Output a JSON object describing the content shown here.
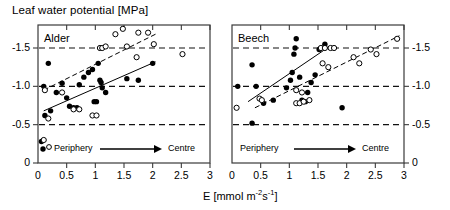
{
  "figure": {
    "y_axis_title": "Leaf water potential [MPa]",
    "x_axis_title_prefix": "E [mmol m",
    "x_axis_title_sup1": "-2",
    "x_axis_title_mid": "s",
    "x_axis_title_sup2": "-1",
    "x_axis_title_suffix": "]"
  },
  "chart_data": [
    {
      "type": "scatter",
      "title": "Alder",
      "xlabel": "E [mmol m-2s-1]",
      "ylabel": "Leaf water potential [MPa]",
      "xlim": [
        0,
        3
      ],
      "ylim": [
        0,
        -1.8
      ],
      "xticks": [
        0,
        0.5,
        1,
        1.5,
        2,
        2.5,
        3
      ],
      "xticklabels": [
        "0",
        "0.5",
        "1",
        "1.5",
        "2",
        "2.5",
        "3"
      ],
      "yticks": [
        -1.5,
        -1.0,
        -0.5,
        0
      ],
      "yticklabels": [
        "-1.5",
        "-1.0",
        "-0.5",
        "0"
      ],
      "gridlines": {
        "y": [
          -1.5,
          -1.0,
          -0.5
        ],
        "style": "dashed"
      },
      "legend_position": "inside-bottom",
      "annotation": {
        "left_label": "Periphery",
        "right_label": "Centre",
        "arrow": "right"
      },
      "series": [
        {
          "name": "filled",
          "marker": "filled-circle",
          "points": [
            [
              0.18,
              -1.3
            ],
            [
              0.1,
              -1.0
            ],
            [
              0.32,
              -0.92
            ],
            [
              0.42,
              -1.04
            ],
            [
              0.5,
              -0.85
            ],
            [
              0.55,
              -0.74
            ],
            [
              0.62,
              -0.72
            ],
            [
              0.68,
              -0.72
            ],
            [
              0.72,
              -1.02
            ],
            [
              0.8,
              -1.12
            ],
            [
              0.88,
              -1.18
            ],
            [
              0.95,
              -1.22
            ],
            [
              0.98,
              -0.8
            ],
            [
              1.02,
              -0.8
            ],
            [
              1.05,
              -1.3
            ],
            [
              1.08,
              -1.08
            ],
            [
              1.1,
              -1.05
            ],
            [
              1.12,
              -0.98
            ],
            [
              1.18,
              -0.92
            ],
            [
              1.55,
              -1.1
            ],
            [
              1.75,
              -1.08
            ],
            [
              2.0,
              -1.3
            ],
            [
              0.12,
              -0.62
            ],
            [
              0.22,
              -0.68
            ],
            [
              0.06,
              -0.28
            ]
          ]
        },
        {
          "name": "open",
          "marker": "open-circle",
          "points": [
            [
              0.12,
              -0.95
            ],
            [
              0.18,
              -0.58
            ],
            [
              0.42,
              -0.92
            ],
            [
              0.62,
              -0.7
            ],
            [
              0.72,
              -0.7
            ],
            [
              0.95,
              -0.62
            ],
            [
              1.02,
              -0.62
            ],
            [
              1.08,
              -1.5
            ],
            [
              1.12,
              -1.5
            ],
            [
              1.18,
              -1.52
            ],
            [
              1.35,
              -1.68
            ],
            [
              1.48,
              -1.75
            ],
            [
              1.55,
              -1.52
            ],
            [
              1.75,
              -1.7
            ],
            [
              1.92,
              -1.7
            ],
            [
              2.02,
              -1.55
            ],
            [
              1.72,
              -1.38
            ],
            [
              2.52,
              -1.42
            ],
            [
              0.1,
              -0.3
            ]
          ]
        }
      ],
      "fit_lines": [
        {
          "name": "filled-fit",
          "style": "solid",
          "x": [
            0.1,
            2.05
          ],
          "y": [
            -0.68,
            -1.32
          ]
        },
        {
          "name": "open-fit",
          "style": "dashed",
          "x": [
            0.1,
            2.05
          ],
          "y": [
            -0.95,
            -1.68
          ]
        }
      ]
    },
    {
      "type": "scatter",
      "title": "Beech",
      "xlabel": "E [mmol m-2s-1]",
      "ylabel": "Leaf water potential [MPa]",
      "xlim": [
        0,
        3
      ],
      "ylim": [
        0,
        -1.8
      ],
      "xticks": [
        0,
        0.5,
        1,
        1.5,
        2,
        2.5,
        3
      ],
      "xticklabels": [
        "0",
        "0.5",
        "1",
        "1.5",
        "2",
        "2.5",
        "3"
      ],
      "yticks": [
        -1.5,
        -1.0,
        -0.5,
        0
      ],
      "yticklabels": [
        "-1.5",
        "-1.0",
        "-0.5",
        "0"
      ],
      "gridlines": {
        "y": [
          -1.5,
          -1.0,
          -0.5
        ],
        "style": "dashed"
      },
      "legend_position": "inside-bottom",
      "annotation": {
        "left_label": "Periphery",
        "right_label": "Centre",
        "arrow": "right"
      },
      "series": [
        {
          "name": "filled",
          "marker": "filled-circle",
          "points": [
            [
              0.35,
              -1.28
            ],
            [
              0.1,
              -1.0
            ],
            [
              0.42,
              -1.0
            ],
            [
              0.35,
              -0.52
            ],
            [
              0.55,
              -0.78
            ],
            [
              0.72,
              -0.82
            ],
            [
              0.95,
              -0.98
            ],
            [
              1.02,
              -1.08
            ],
            [
              1.05,
              -1.18
            ],
            [
              1.08,
              -1.42
            ],
            [
              1.1,
              -1.5
            ],
            [
              1.12,
              -1.62
            ],
            [
              1.18,
              -1.12
            ],
            [
              1.22,
              -0.82
            ],
            [
              1.28,
              -0.8
            ],
            [
              1.32,
              -0.92
            ],
            [
              1.38,
              -1.05
            ],
            [
              1.45,
              -1.15
            ],
            [
              1.52,
              -1.48
            ],
            [
              1.62,
              -1.55
            ],
            [
              1.92,
              -0.72
            ]
          ]
        },
        {
          "name": "open",
          "marker": "open-circle",
          "points": [
            [
              0.48,
              -0.84
            ],
            [
              0.52,
              -0.82
            ],
            [
              1.12,
              -0.78
            ],
            [
              1.18,
              -0.78
            ],
            [
              1.25,
              -0.8
            ],
            [
              1.35,
              -0.82
            ],
            [
              1.12,
              -0.95
            ],
            [
              1.22,
              -0.92
            ],
            [
              1.55,
              -1.5
            ],
            [
              1.62,
              -1.5
            ],
            [
              1.72,
              -1.5
            ],
            [
              1.78,
              -1.5
            ],
            [
              1.58,
              -1.3
            ],
            [
              1.68,
              -1.25
            ],
            [
              2.12,
              -1.38
            ],
            [
              2.22,
              -1.3
            ],
            [
              2.42,
              -1.48
            ],
            [
              2.52,
              -1.42
            ],
            [
              2.88,
              -1.62
            ],
            [
              0.08,
              -0.72
            ]
          ]
        }
      ],
      "fit_lines": [
        {
          "name": "filled-fit",
          "style": "solid",
          "x": [
            0.28,
            1.7
          ],
          "y": [
            -0.8,
            -1.52
          ]
        },
        {
          "name": "open-fit",
          "style": "dashed",
          "x": [
            0.4,
            2.92
          ],
          "y": [
            -0.72,
            -1.66
          ]
        }
      ]
    }
  ]
}
